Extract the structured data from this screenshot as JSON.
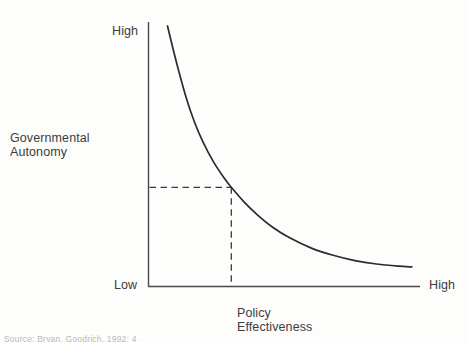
{
  "chart_data": {
    "type": "line",
    "title": "",
    "subtitle": "",
    "xlabel": "Policy Effectiveness",
    "ylabel": "Governmental Autonomy",
    "xlabel_lines": [
      "Policy",
      "Effectiveness"
    ],
    "ylabel_lines": [
      "Governmental",
      "Autonomy"
    ],
    "x_tick_labels": [
      "Low",
      "High"
    ],
    "y_tick_labels": [
      "Low",
      "High"
    ],
    "xlim": [
      0,
      1
    ],
    "ylim": [
      0,
      1
    ],
    "grid": false,
    "legend": null,
    "series": [
      {
        "name": "Autonomy vs Effectiveness tradeoff",
        "description": "Monotonically decreasing convex (hyperbolic) curve",
        "x": [
          0.07,
          0.09,
          0.11,
          0.14,
          0.17,
          0.2,
          0.24,
          0.28,
          0.305,
          0.35,
          0.4,
          0.46,
          0.52,
          0.6,
          0.68,
          0.76,
          0.84,
          0.92,
          0.97
        ],
        "y": [
          0.985,
          0.9,
          0.82,
          0.71,
          0.62,
          0.548,
          0.47,
          0.408,
          0.375,
          0.322,
          0.272,
          0.222,
          0.184,
          0.145,
          0.118,
          0.098,
          0.085,
          0.077,
          0.074
        ]
      }
    ],
    "annotations": [
      {
        "name": "reference-lines",
        "type": "dashed-crosshair",
        "x": 0.305,
        "y": 0.375,
        "style": "dashed",
        "description": "Dashed horizontal and vertical guide lines meeting the curve"
      }
    ]
  },
  "axes": {
    "y_high": "High",
    "y_low": "Low",
    "x_high": "High",
    "y_title_line1": "Governmental",
    "y_title_line2": "Autonomy",
    "x_title_line1": "Policy",
    "x_title_line2": "Effectiveness"
  },
  "footer": {
    "source_note": "Source: Bryan, Goodrich, 1992: 4"
  },
  "colors": {
    "background": "#fdfdfc",
    "axis": "#4a4a4a",
    "curve": "#2b2b2b",
    "dashed": "#3a3a3a",
    "text": "#3c3c3c"
  }
}
